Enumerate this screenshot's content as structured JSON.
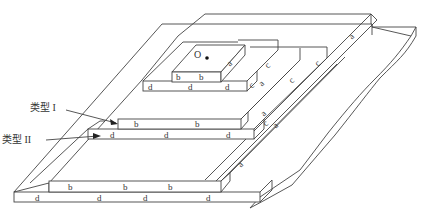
{
  "diagram": {
    "origin_label": "O",
    "callouts": [
      {
        "label": "类型 I",
        "x": 47,
        "y": 121,
        "arrow_to": [
          118,
          128
        ]
      },
      {
        "label": "类型 II",
        "x": 22,
        "y": 142,
        "arrow_to": [
          101,
          138
        ]
      }
    ],
    "edge_labels": {
      "top_block_front": [
        "b",
        "b"
      ],
      "top_block_side": [
        "a"
      ],
      "level1_front": [
        "d",
        "d",
        "d"
      ],
      "level1_side": [
        "c",
        "a",
        "c"
      ],
      "level2_front": [
        "b",
        "b",
        "b"
      ],
      "level2_side": [
        "a",
        "c",
        "a",
        "c"
      ],
      "level3_front": [
        "d",
        "d",
        "d"
      ],
      "level3_side": [
        "c",
        "a"
      ],
      "level4_front": [
        "b",
        "b",
        "b"
      ],
      "level4_side": [
        "a"
      ],
      "base_front": [
        "d",
        "d",
        "d",
        "d"
      ],
      "outer_slope": [
        "a"
      ]
    },
    "colors": {
      "line": "#444444",
      "text": "#333333",
      "background": "#ffffff"
    }
  }
}
